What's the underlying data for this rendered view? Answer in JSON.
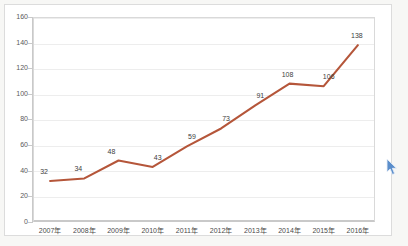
{
  "chart_data": {
    "type": "line",
    "title": "",
    "subtitle": "",
    "xlabel": "",
    "ylabel": "",
    "categories": [
      "2007年",
      "2008年",
      "2009年",
      "2010年",
      "2011年",
      "2012年",
      "2013年",
      "2014年",
      "2015年",
      "2016年"
    ],
    "values": [
      32,
      34,
      48,
      43,
      59,
      73,
      91,
      108,
      106,
      138
    ],
    "series": [
      {
        "name": "",
        "values": [
          32,
          34,
          48,
          43,
          59,
          73,
          91,
          108,
          106,
          138
        ]
      }
    ],
    "data_labels": [
      "32",
      "34",
      "48",
      "43",
      "59",
      "73",
      "91",
      "108",
      "106",
      "138"
    ],
    "ylim": [
      0,
      160
    ],
    "yticks": [
      0,
      20,
      40,
      60,
      80,
      100,
      120,
      140,
      160
    ],
    "ytick_labels": [
      "0",
      "20",
      "40",
      "60",
      "80",
      "100",
      "120",
      "140",
      "160"
    ],
    "grid": true,
    "grid_axis": "y",
    "legend": false,
    "legend_position": "none",
    "line_color": "#b5563a",
    "grid_color": "#ededed",
    "axis_color": "#c9c9c9",
    "label_color": "#3d3d3d",
    "plot_background": "#ffffff",
    "page_background": "#f7f7f5"
  },
  "artifacts": {
    "cursor_icon": "mouse-pointer-icon",
    "cursor_color": "#4a7fc1"
  }
}
